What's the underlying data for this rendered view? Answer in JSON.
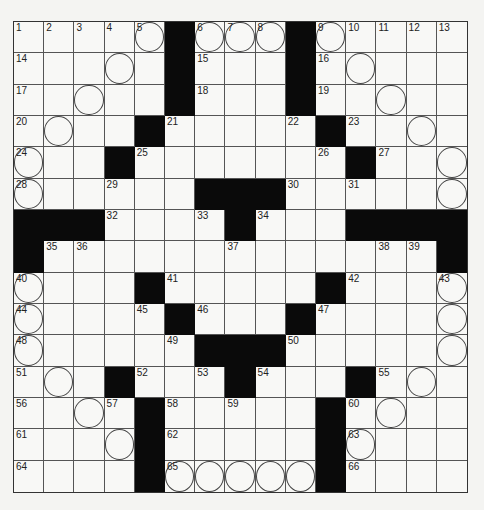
{
  "puzzle": {
    "rows": 15,
    "cols": 15,
    "layout": [
      "11111011101111",
      "x"
    ],
    "grid": [
      ".....#...#.....",
      ".....#...#.....",
      ".....#...#.....",
      "....#....#.#...",
      "...#......#.#..",
      "......###......",
      "###....#...####",
      "#.............#",
      "....#.....#....",
      "....#...#......",
      "......###......",
      "...#...#...#...",
      "....#.....#....",
      "....#.....#....",
      "....#.....#...."
    ],
    "black_cells": [
      [
        1,
        6
      ],
      [
        1,
        10
      ],
      [
        2,
        6
      ],
      [
        2,
        10
      ],
      [
        3,
        6
      ],
      [
        3,
        10
      ],
      [
        4,
        5
      ],
      [
        4,
        11
      ],
      [
        5,
        4
      ],
      [
        5,
        12
      ],
      [
        6,
        7
      ],
      [
        6,
        8
      ],
      [
        6,
        9
      ],
      [
        7,
        1
      ],
      [
        7,
        2
      ],
      [
        7,
        3
      ],
      [
        7,
        8
      ],
      [
        7,
        12
      ],
      [
        7,
        13
      ],
      [
        7,
        14
      ],
      [
        7,
        15
      ],
      [
        8,
        1
      ],
      [
        8,
        15
      ],
      [
        9,
        5
      ],
      [
        9,
        11
      ],
      [
        10,
        6
      ],
      [
        10,
        10
      ],
      [
        11,
        7
      ],
      [
        11,
        8
      ],
      [
        11,
        9
      ],
      [
        12,
        4
      ],
      [
        12,
        8
      ],
      [
        12,
        12
      ],
      [
        13,
        5
      ],
      [
        13,
        11
      ],
      [
        14,
        5
      ],
      [
        14,
        11
      ],
      [
        15,
        5
      ],
      [
        15,
        11
      ]
    ],
    "numbers": [
      {
        "n": "1",
        "r": 1,
        "c": 1
      },
      {
        "n": "2",
        "r": 1,
        "c": 2
      },
      {
        "n": "3",
        "r": 1,
        "c": 3
      },
      {
        "n": "4",
        "r": 1,
        "c": 4
      },
      {
        "n": "5",
        "r": 1,
        "c": 5
      },
      {
        "n": "6",
        "r": 1,
        "c": 7
      },
      {
        "n": "7",
        "r": 1,
        "c": 8
      },
      {
        "n": "8",
        "r": 1,
        "c": 9
      },
      {
        "n": "9",
        "r": 1,
        "c": 11
      },
      {
        "n": "10",
        "r": 1,
        "c": 12
      },
      {
        "n": "11",
        "r": 1,
        "c": 13
      },
      {
        "n": "12",
        "r": 1,
        "c": 14
      },
      {
        "n": "13",
        "r": 1,
        "c": 15
      },
      {
        "n": "14",
        "r": 2,
        "c": 1
      },
      {
        "n": "15",
        "r": 2,
        "c": 7
      },
      {
        "n": "16",
        "r": 2,
        "c": 11
      },
      {
        "n": "17",
        "r": 3,
        "c": 1
      },
      {
        "n": "18",
        "r": 3,
        "c": 7
      },
      {
        "n": "19",
        "r": 3,
        "c": 11
      },
      {
        "n": "20",
        "r": 4,
        "c": 1
      },
      {
        "n": "21",
        "r": 4,
        "c": 6
      },
      {
        "n": "22",
        "r": 4,
        "c": 10
      },
      {
        "n": "23",
        "r": 4,
        "c": 12
      },
      {
        "n": "24",
        "r": 5,
        "c": 1
      },
      {
        "n": "25",
        "r": 5,
        "c": 5
      },
      {
        "n": "26",
        "r": 5,
        "c": 11
      },
      {
        "n": "27",
        "r": 5,
        "c": 13
      },
      {
        "n": "28",
        "r": 6,
        "c": 1
      },
      {
        "n": "29",
        "r": 6,
        "c": 4
      },
      {
        "n": "30",
        "r": 6,
        "c": 10
      },
      {
        "n": "31",
        "r": 6,
        "c": 12
      },
      {
        "n": "32",
        "r": 7,
        "c": 4
      },
      {
        "n": "33",
        "r": 7,
        "c": 7
      },
      {
        "n": "34",
        "r": 7,
        "c": 9
      },
      {
        "n": "35",
        "r": 8,
        "c": 2
      },
      {
        "n": "36",
        "r": 8,
        "c": 3
      },
      {
        "n": "37",
        "r": 8,
        "c": 8
      },
      {
        "n": "38",
        "r": 8,
        "c": 13
      },
      {
        "n": "39",
        "r": 8,
        "c": 14
      },
      {
        "n": "40",
        "r": 9,
        "c": 1
      },
      {
        "n": "41",
        "r": 9,
        "c": 6
      },
      {
        "n": "42",
        "r": 9,
        "c": 12
      },
      {
        "n": "43",
        "r": 9,
        "c": 15
      },
      {
        "n": "44",
        "r": 10,
        "c": 1
      },
      {
        "n": "45",
        "r": 10,
        "c": 5
      },
      {
        "n": "46",
        "r": 10,
        "c": 7
      },
      {
        "n": "47",
        "r": 10,
        "c": 11
      },
      {
        "n": "48",
        "r": 11,
        "c": 1
      },
      {
        "n": "49",
        "r": 11,
        "c": 6
      },
      {
        "n": "50",
        "r": 11,
        "c": 10
      },
      {
        "n": "51",
        "r": 12,
        "c": 1
      },
      {
        "n": "52",
        "r": 12,
        "c": 5
      },
      {
        "n": "53",
        "r": 12,
        "c": 7
      },
      {
        "n": "54",
        "r": 12,
        "c": 9
      },
      {
        "n": "55",
        "r": 12,
        "c": 13
      },
      {
        "n": "56",
        "r": 13,
        "c": 1
      },
      {
        "n": "57",
        "r": 13,
        "c": 4
      },
      {
        "n": "58",
        "r": 13,
        "c": 6
      },
      {
        "n": "59",
        "r": 13,
        "c": 8
      },
      {
        "n": "60",
        "r": 13,
        "c": 12
      },
      {
        "n": "61",
        "r": 14,
        "c": 1
      },
      {
        "n": "62",
        "r": 14,
        "c": 6
      },
      {
        "n": "63",
        "r": 14,
        "c": 12
      },
      {
        "n": "64",
        "r": 15,
        "c": 1
      },
      {
        "n": "65",
        "r": 15,
        "c": 6
      },
      {
        "n": "66",
        "r": 15,
        "c": 12
      }
    ],
    "circles": [
      [
        1,
        5
      ],
      [
        1,
        7
      ],
      [
        1,
        8
      ],
      [
        1,
        9
      ],
      [
        1,
        11
      ],
      [
        2,
        4
      ],
      [
        2,
        12
      ],
      [
        3,
        3
      ],
      [
        3,
        13
      ],
      [
        4,
        2
      ],
      [
        4,
        14
      ],
      [
        5,
        1
      ],
      [
        5,
        15
      ],
      [
        6,
        1
      ],
      [
        6,
        15
      ],
      [
        9,
        1
      ],
      [
        9,
        15
      ],
      [
        10,
        1
      ],
      [
        10,
        15
      ],
      [
        11,
        1
      ],
      [
        11,
        15
      ],
      [
        12,
        2
      ],
      [
        12,
        14
      ],
      [
        13,
        3
      ],
      [
        13,
        13
      ],
      [
        14,
        4
      ],
      [
        14,
        12
      ],
      [
        15,
        6
      ],
      [
        15,
        7
      ],
      [
        15,
        8
      ],
      [
        15,
        9
      ],
      [
        15,
        10
      ]
    ]
  },
  "colors": {
    "black_cell": "#0a0a0a",
    "white_cell": "#f8f8f6",
    "grid_line": "#555555"
  }
}
